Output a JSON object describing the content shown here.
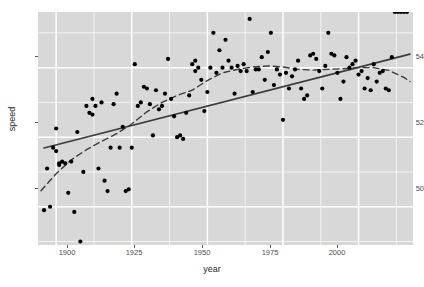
{
  "chart": {
    "type": "scatter",
    "title": "",
    "xlabel": "year",
    "ylabel": "speed",
    "xticks": [
      "1900",
      "1925",
      "1950",
      "1975",
      "2000"
    ],
    "yticks": [
      "50",
      "52",
      "54"
    ],
    "xlim": [
      1894,
      2018
    ],
    "ylim": [
      48.9,
      55.6
    ],
    "grid": true,
    "legend": false,
    "panel_bg": "#d8d8d8",
    "grid_color": "#ffffff",
    "point_color": "#000000",
    "line_color": "#3b3b3b",
    "series": [
      {
        "name": "observations",
        "type": "scatter",
        "x": [
          1896,
          1897,
          1898,
          1899,
          1900,
          1900,
          1901,
          1901,
          1902,
          1903,
          1904,
          1905,
          1906,
          1907,
          1908,
          1909,
          1910,
          1911,
          1912,
          1912,
          1913,
          1914,
          1915,
          1916,
          1917,
          1918,
          1919,
          1920,
          1921,
          1922,
          1923,
          1924,
          1925,
          1926,
          1927,
          1928,
          1929,
          1930,
          1931,
          1932,
          1933,
          1934,
          1935,
          1936,
          1937,
          1938,
          1939,
          1940,
          1941,
          1942,
          1943,
          1944,
          1945,
          1946,
          1946,
          1947,
          1948,
          1949,
          1950,
          1951,
          1952,
          1953,
          1954,
          1955,
          1956,
          1957,
          1958,
          1959,
          1960,
          1961,
          1962,
          1963,
          1964,
          1965,
          1966,
          1967,
          1968,
          1969,
          1970,
          1971,
          1972,
          1973,
          1974,
          1975,
          1976,
          1977,
          1978,
          1979,
          1980,
          1981,
          1982,
          1983,
          1984,
          1985,
          1986,
          1987,
          1988,
          1989,
          1990,
          1991,
          1992,
          1993,
          1994,
          1995,
          1996,
          1997,
          1998,
          1999,
          2000,
          2001,
          2002,
          2003,
          2004,
          2005,
          2006,
          2007,
          2008,
          2009,
          2010,
          2011,
          2012,
          2013,
          2014,
          2015,
          2016
        ],
        "y": [
          49.9,
          51.1,
          50.0,
          51.7,
          51.6,
          52.25,
          51.2,
          51.25,
          51.3,
          51.25,
          50.4,
          51.3,
          49.85,
          52.15,
          49.0,
          51.0,
          52.9,
          52.7,
          53.1,
          52.65,
          52.9,
          51.1,
          53.0,
          50.75,
          50.45,
          51.7,
          52.95,
          53.25,
          51.7,
          52.3,
          50.45,
          50.5,
          51.7,
          54.1,
          52.9,
          53.0,
          53.45,
          53.4,
          52.95,
          52.05,
          53.35,
          52.8,
          52.9,
          53.25,
          54.25,
          53.1,
          52.6,
          52.0,
          52.05,
          51.95,
          52.7,
          53.2,
          54.1,
          54.2,
          53.9,
          54.0,
          53.65,
          52.75,
          53.3,
          54.0,
          55.0,
          53.85,
          54.5,
          54.0,
          54.8,
          54.2,
          54.0,
          53.25,
          54.05,
          53.9,
          54.1,
          53.9,
          55.4,
          53.3,
          53.95,
          53.95,
          54.3,
          53.65,
          54.45,
          55.0,
          53.5,
          53.95,
          53.8,
          52.5,
          53.85,
          53.4,
          53.75,
          53.95,
          54.2,
          53.4,
          53.1,
          53.2,
          54.35,
          54.4,
          54.25,
          53.9,
          53.4,
          54.05,
          55.0,
          54.4,
          54.35,
          53.85,
          53.1,
          53.6,
          54.3,
          54.0,
          54.1,
          54.2,
          53.8,
          53.9,
          53.4,
          53.7,
          53.35,
          54.1,
          53.6,
          53.85,
          53.9,
          53.4,
          53.35,
          54.3
        ]
      },
      {
        "name": "linear-trend",
        "type": "line",
        "style": "solid",
        "x": [
          1896,
          2017
        ],
        "y": [
          51.69,
          54.39
        ]
      },
      {
        "name": "loess-smooth",
        "type": "line",
        "style": "dashed",
        "x": [
          1895,
          1900,
          1905,
          1910,
          1915,
          1920,
          1925,
          1930,
          1935,
          1940,
          1945,
          1950,
          1955,
          1960,
          1965,
          1970,
          1975,
          1980,
          1985,
          1990,
          1995,
          2000,
          2005,
          2010,
          2015,
          2017
        ],
        "y": [
          50.46,
          50.95,
          51.35,
          51.64,
          51.88,
          52.1,
          52.38,
          52.73,
          53.0,
          53.2,
          53.35,
          53.63,
          53.85,
          53.95,
          54.02,
          54.05,
          54.02,
          53.95,
          53.93,
          53.95,
          53.97,
          54.0,
          54.0,
          53.92,
          53.72,
          53.6
        ]
      }
    ]
  }
}
